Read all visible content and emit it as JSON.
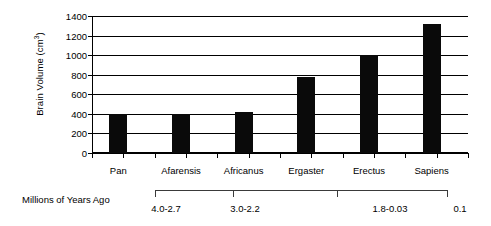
{
  "chart_data": {
    "type": "bar",
    "title": "",
    "xlabel": "Millions of Years Ago",
    "ylabel": "Brain Volume (cm3)",
    "ylabel_main": "Brain Volume (cm",
    "ylabel_sup": "3",
    "ylabel_tail": ")",
    "categories": [
      "Pan",
      "Afarensis",
      "Africanus",
      "Ergaster",
      "Erectus",
      "Sapiens"
    ],
    "values": [
      400,
      400,
      420,
      780,
      1000,
      1320
    ],
    "ylim": [
      0,
      1400
    ],
    "ytick_values": [
      0,
      200,
      400,
      600,
      800,
      1000,
      1200,
      1400
    ],
    "ytick_labels": [
      "0",
      "200",
      "400",
      "600",
      "800",
      "1000",
      "1200",
      "1400"
    ],
    "grid": true,
    "legend": null,
    "bar_color": "#0a0a0a",
    "axis_color": "#000000",
    "secondary_axis": {
      "label": "Millions of Years Ago",
      "ranges": [
        "4.0-2.7",
        "3.0-2.2",
        "1.8-0.03",
        "0.1"
      ]
    }
  }
}
